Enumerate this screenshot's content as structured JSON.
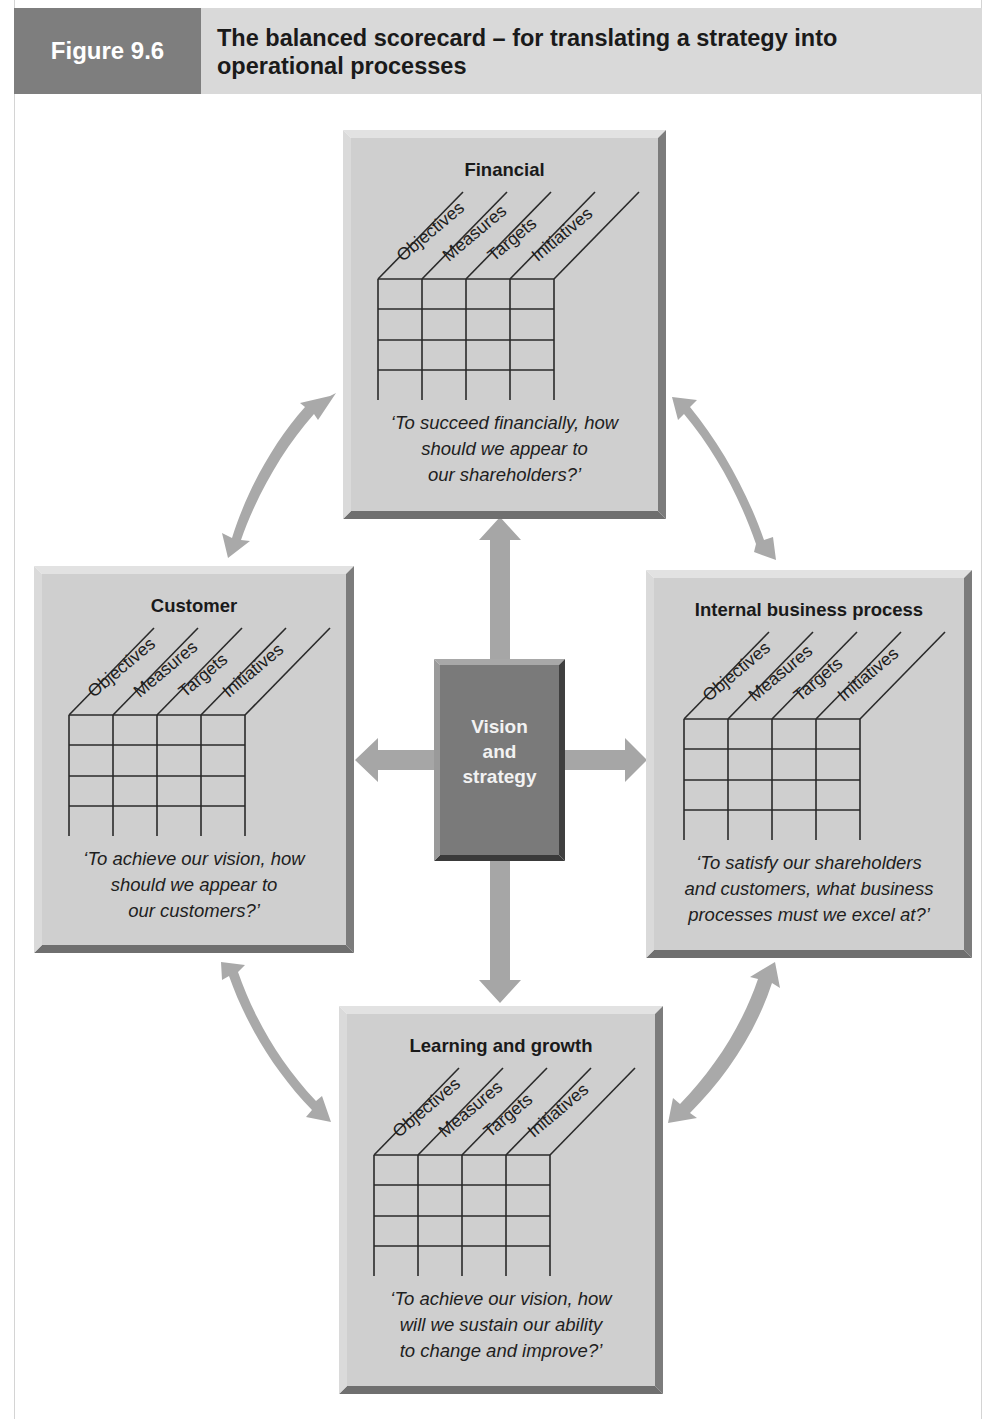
{
  "header": {
    "figure_label": "Figure 9.6",
    "title_line1": "The balanced scorecard – for translating a strategy into",
    "title_line2": "operational processes"
  },
  "center": {
    "line1": "Vision",
    "line2": "and",
    "line3": "strategy"
  },
  "columns": [
    "Objectives",
    "Measures",
    "Targets",
    "Initiatives"
  ],
  "panels": {
    "financial": {
      "title": "Financial",
      "question": [
        "‘To succeed financially, how",
        "should we appear to",
        "our shareholders?’"
      ]
    },
    "customer": {
      "title": "Customer",
      "question": [
        "‘To achieve our vision, how",
        "should we appear to",
        "our customers?’"
      ]
    },
    "internal": {
      "title": "Internal business process",
      "question": [
        "‘To satisfy our shareholders",
        "and customers, what business",
        "processes must we excel at?’"
      ]
    },
    "learning": {
      "title": "Learning and growth",
      "question": [
        "‘To achieve our vision, how",
        "will we sustain our ability",
        "to change and improve?’"
      ]
    }
  },
  "colors": {
    "header_label_bg": "#7e7e7e",
    "header_title_bg": "#d9d9d9",
    "panel_face": "#cfcfcf",
    "panel_shadow": "#8a8a8a",
    "center_face": "#7a7a7a",
    "arrow": "#a9a9a9",
    "grid_line": "#2a2a2a"
  }
}
